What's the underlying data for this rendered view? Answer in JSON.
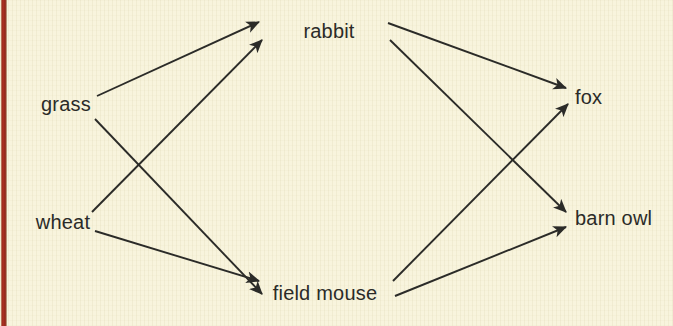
{
  "figure": {
    "kind": "food-web-diagram",
    "background_color": "#f8f4dd",
    "spine_color": "#a82f21",
    "ink_color": "#2b2b28",
    "width": 673,
    "height": 326
  },
  "nodes": [
    {
      "id": "grass",
      "label": "grass",
      "x": 66,
      "y": 104,
      "anchor": "mid"
    },
    {
      "id": "wheat",
      "label": "wheat",
      "x": 63,
      "y": 222,
      "anchor": "mid"
    },
    {
      "id": "rabbit",
      "label": "rabbit",
      "x": 329,
      "y": 31,
      "anchor": "mid"
    },
    {
      "id": "field_mouse",
      "label": "field mouse",
      "x": 325,
      "y": 293,
      "anchor": "mid"
    },
    {
      "id": "fox",
      "label": "fox",
      "x": 575,
      "y": 97,
      "anchor": "left"
    },
    {
      "id": "barn_owl",
      "label": "barn owl",
      "x": 575,
      "y": 218,
      "anchor": "left"
    }
  ],
  "edges": [
    {
      "id": "grass-to-rabbit",
      "from": "grass",
      "to": "rabbit",
      "x1": 97,
      "y1": 96,
      "x2": 259,
      "y2": 22
    },
    {
      "id": "grass-to-field-mouse",
      "from": "grass",
      "to": "field mouse",
      "x1": 95,
      "y1": 119,
      "x2": 262,
      "y2": 294
    },
    {
      "id": "wheat-to-rabbit",
      "from": "wheat",
      "to": "rabbit",
      "x1": 92,
      "y1": 212,
      "x2": 262,
      "y2": 40
    },
    {
      "id": "wheat-to-field-mouse",
      "from": "wheat",
      "to": "field mouse",
      "x1": 95,
      "y1": 231,
      "x2": 259,
      "y2": 281
    },
    {
      "id": "rabbit-to-fox",
      "from": "rabbit",
      "to": "fox",
      "x1": 388,
      "y1": 23,
      "x2": 566,
      "y2": 88
    },
    {
      "id": "rabbit-to-barn-owl",
      "from": "rabbit",
      "to": "barn owl",
      "x1": 390,
      "y1": 40,
      "x2": 566,
      "y2": 212
    },
    {
      "id": "field-mouse-to-fox",
      "from": "field mouse",
      "to": "fox",
      "x1": 393,
      "y1": 281,
      "x2": 568,
      "y2": 104
    },
    {
      "id": "field-mouse-to-barn-owl",
      "from": "field mouse",
      "to": "barn owl",
      "x1": 395,
      "y1": 296,
      "x2": 566,
      "y2": 227
    }
  ]
}
